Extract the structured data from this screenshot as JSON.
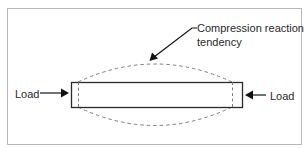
{
  "diagram": {
    "type": "column-buckling-illustration",
    "labels": {
      "left_load": "Load",
      "right_load": "Load",
      "annotation_line1": "Compression reaction",
      "annotation_line2": "tendency"
    },
    "colors": {
      "frame": "#b8b8b8",
      "stroke": "#2a2a2a",
      "dashed": "#707070",
      "text": "#2a2a2a",
      "background": "#ffffff"
    },
    "icons": {
      "left_arrow": "arrow-right-icon",
      "right_arrow": "arrow-left-icon",
      "pointer_arrow": "arrow-down-left-icon"
    }
  }
}
